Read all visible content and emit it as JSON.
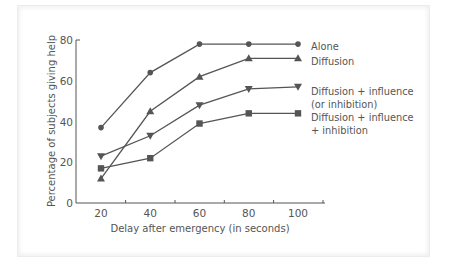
{
  "chart_data": {
    "type": "line",
    "title": "",
    "xlabel": "Delay after emergency (in seconds)",
    "ylabel": "Percentage of subjects giving help",
    "x": [
      20,
      40,
      60,
      80,
      100
    ],
    "xticks": [
      "20",
      "40",
      "60",
      "80",
      "100"
    ],
    "yticks": [
      "0",
      "20",
      "40",
      "60",
      "80"
    ],
    "ylim": [
      0,
      80
    ],
    "xlim": [
      10,
      110
    ],
    "grid": false,
    "legend_position": "right (inline labels)",
    "series": [
      {
        "name": "Alone",
        "marker": "circle",
        "values": [
          37,
          64,
          78,
          78,
          78
        ],
        "legend_lines": [
          "Alone"
        ]
      },
      {
        "name": "Diffusion",
        "marker": "triangle-up",
        "values": [
          12,
          45,
          62,
          71,
          71
        ],
        "legend_lines": [
          "Diffusion"
        ]
      },
      {
        "name": "Diffusion + influence (or inhibition)",
        "marker": "triangle-down",
        "values": [
          23,
          33,
          48,
          56,
          57
        ],
        "legend_lines": [
          "Diffusion + influence",
          "(or inhibition)"
        ]
      },
      {
        "name": "Diffusion + influence + inhibition",
        "marker": "square",
        "values": [
          17,
          22,
          39,
          44,
          44
        ],
        "legend_lines": [
          "Diffusion + influence",
          "+ inhibition"
        ]
      }
    ],
    "colors": {
      "line": "#555555",
      "text": "#555555",
      "axis": "#555555"
    }
  }
}
